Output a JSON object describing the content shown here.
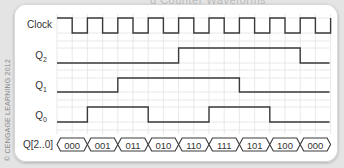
{
  "figure": {
    "title_partial": "g Counter Waveforms",
    "copyright": "© CENGAGE LEARNING 2012"
  },
  "signals": {
    "clock": {
      "label": "Clock"
    },
    "q2": {
      "label": "Q",
      "sub": "2"
    },
    "q1": {
      "label": "Q",
      "sub": "1"
    },
    "q0": {
      "label": "Q",
      "sub": "0"
    },
    "bus": {
      "label": "Q[2..0]",
      "values": [
        "000",
        "001",
        "011",
        "010",
        "110",
        "111",
        "101",
        "100",
        "000"
      ]
    }
  },
  "waveform_data": {
    "clock_cycles": 9,
    "q2": [
      0,
      0,
      0,
      0,
      1,
      1,
      1,
      1,
      0
    ],
    "q1": [
      0,
      0,
      1,
      1,
      1,
      1,
      0,
      0,
      0
    ],
    "q0": [
      0,
      1,
      1,
      0,
      0,
      1,
      1,
      0,
      0
    ]
  },
  "colors": {
    "trace": "#3a3a3a",
    "grid": "#e2e2e2",
    "card": "#ffffff",
    "background": "#e4e4e4"
  }
}
